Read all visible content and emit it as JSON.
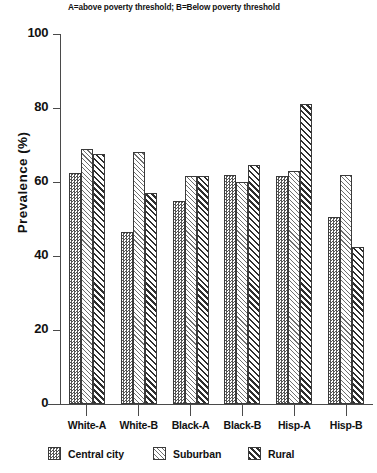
{
  "chart_data": {
    "type": "bar",
    "title": "A=above poverty threshold; B=Below poverty threshold",
    "xlabel": "",
    "ylabel": "Prevalence (%)",
    "ylim": [
      0,
      100
    ],
    "yticks": [
      0,
      20,
      40,
      60,
      80,
      100
    ],
    "ytick_labels": [
      "0",
      "20",
      "40",
      "60",
      "80",
      "100"
    ],
    "grid": false,
    "legend_position": "bottom",
    "categories": [
      "White-A",
      "White-B",
      "Black-A",
      "Black-B",
      "Hisp-A",
      "Hisp-B"
    ],
    "series": [
      {
        "name": "Central city",
        "pattern": "fine-checkerboard",
        "values": [
          62.5,
          46.5,
          55.0,
          62.0,
          61.5,
          50.5
        ]
      },
      {
        "name": "Suburban",
        "pattern": "diagonal-hatch",
        "values": [
          69.0,
          68.0,
          61.5,
          60.0,
          63.0,
          62.0
        ]
      },
      {
        "name": "Rural",
        "pattern": "crosshatch",
        "values": [
          67.5,
          57.0,
          61.5,
          64.5,
          81.0,
          42.5
        ]
      }
    ]
  },
  "axis": {
    "y_title": "Prevalence (%)"
  },
  "legend": {
    "items": [
      {
        "label": "Central city"
      },
      {
        "label": "Suburban"
      },
      {
        "label": "Rural"
      }
    ]
  }
}
